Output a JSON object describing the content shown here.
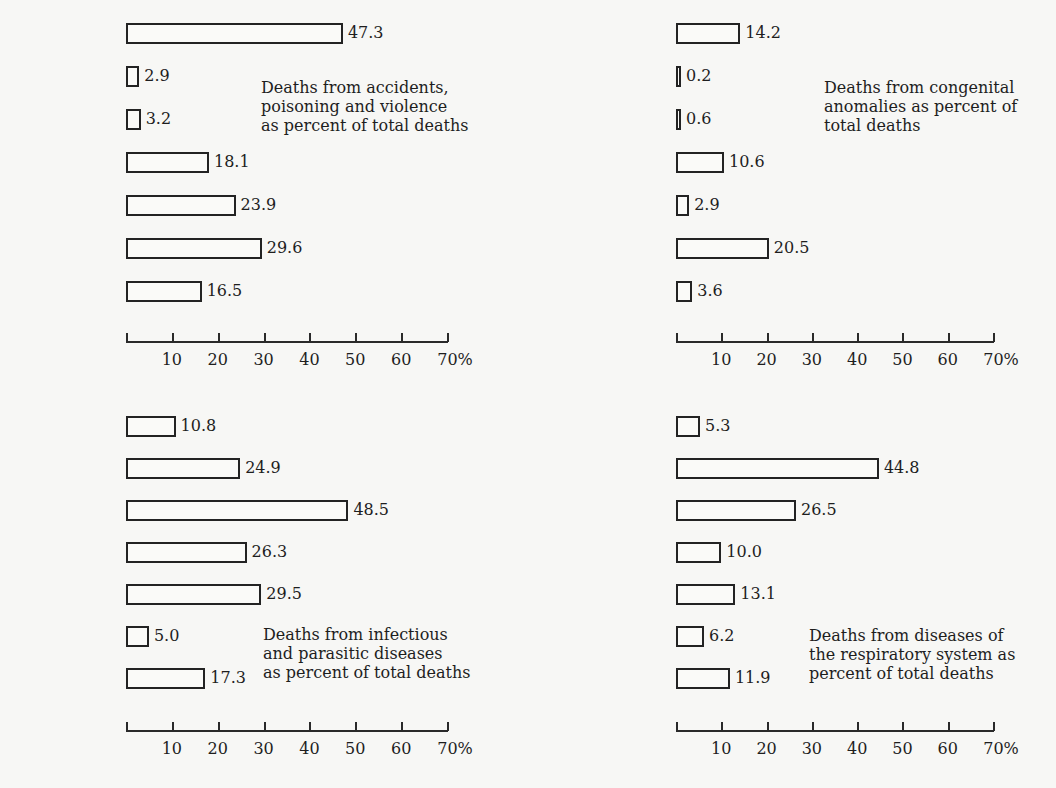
{
  "figure": {
    "categories": [
      "Canada",
      "Ecuador",
      "Philippines",
      "Singapore",
      "Portugal",
      "Sweden",
      "Yugoslavia"
    ],
    "tick_values": [
      10,
      20,
      30,
      40,
      50,
      60,
      70
    ],
    "tick_labels": [
      "10",
      "20",
      "30",
      "40",
      "50",
      "60",
      "70%"
    ]
  },
  "chart_data": [
    {
      "type": "bar",
      "orientation": "horizontal",
      "title": "Deaths from accidents, poisoning and violence as percent of total deaths",
      "caption_lines": [
        "Deaths from accidents,",
        "poisoning and violence",
        "as percent of total deaths"
      ],
      "categories": [
        "Canada",
        "Ecuador",
        "Philippines",
        "Singapore",
        "Portugal",
        "Sweden",
        "Yugoslavia"
      ],
      "values": [
        47.3,
        2.9,
        3.2,
        18.1,
        23.9,
        29.6,
        16.5
      ],
      "value_labels": [
        "47.3",
        "2.9",
        "3.2",
        "18.1",
        "23.9",
        "29.6",
        "16.5"
      ],
      "xlabel": "%",
      "ylabel": "",
      "xlim": [
        0,
        70
      ],
      "ticks": [
        "10",
        "20",
        "30",
        "40",
        "50",
        "60",
        "70%"
      ],
      "grid": false,
      "legend": "none"
    },
    {
      "type": "bar",
      "orientation": "horizontal",
      "title": "Deaths from congenital anomalies as percent of total deaths",
      "caption_lines": [
        "Deaths from congenital",
        "anomalies as percent of",
        "total deaths"
      ],
      "categories": [
        "Canada",
        "Ecuador",
        "Philippines",
        "Singapore",
        "Portugal",
        "Sweden",
        "Yugoslavia"
      ],
      "values": [
        14.2,
        0.2,
        0.6,
        10.6,
        2.9,
        20.5,
        3.6
      ],
      "value_labels": [
        "14.2",
        "0.2",
        "0.6",
        "10.6",
        "2.9",
        "20.5",
        "3.6"
      ],
      "xlabel": "%",
      "ylabel": "",
      "xlim": [
        0,
        70
      ],
      "ticks": [
        "10",
        "20",
        "30",
        "40",
        "50",
        "60",
        "70%"
      ],
      "grid": false,
      "legend": "none"
    },
    {
      "type": "bar",
      "orientation": "horizontal",
      "title": "Deaths from infectious and parasitic diseases as percent of total deaths",
      "caption_lines": [
        "Deaths from infectious",
        "and parasitic diseases",
        "as percent of total deaths"
      ],
      "categories": [
        "Canada",
        "Ecuador",
        "Philippines",
        "Singapore",
        "Portugal",
        "Sweden",
        "Yugoslavia"
      ],
      "values": [
        10.8,
        24.9,
        48.5,
        26.3,
        29.5,
        5.0,
        17.3
      ],
      "value_labels": [
        "10.8",
        "24.9",
        "48.5",
        "26.3",
        "29.5",
        "5.0",
        "17.3"
      ],
      "xlabel": "%",
      "ylabel": "",
      "xlim": [
        0,
        70
      ],
      "ticks": [
        "10",
        "20",
        "30",
        "40",
        "50",
        "60",
        "70%"
      ],
      "grid": false,
      "legend": "none"
    },
    {
      "type": "bar",
      "orientation": "horizontal",
      "title": "Deaths from diseases of the respiratory system as percent of total deaths",
      "caption_lines": [
        "Deaths from diseases of",
        "the respiratory system as",
        "percent of total deaths"
      ],
      "categories": [
        "Canada",
        "Ecuador",
        "Philippines",
        "Singapore",
        "Portugal",
        "Sweden",
        "Yugoslavia"
      ],
      "values": [
        5.3,
        44.8,
        26.5,
        10.0,
        13.1,
        6.2,
        11.9
      ],
      "value_labels": [
        "5.3",
        "44.8",
        "26.5",
        "10.0",
        "13.1",
        "6.2",
        "11.9"
      ],
      "xlabel": "%",
      "ylabel": "",
      "xlim": [
        0,
        70
      ],
      "ticks": [
        "10",
        "20",
        "30",
        "40",
        "50",
        "60",
        "70%"
      ],
      "grid": false,
      "legend": "none"
    }
  ]
}
